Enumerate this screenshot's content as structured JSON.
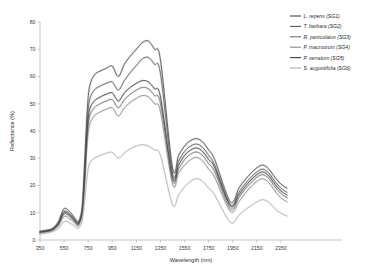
{
  "chart_data": {
    "type": "line",
    "title": "",
    "xlabel": "Wavelength (nm)",
    "ylabel": "Reflectance (%)",
    "xlim": [
      350,
      2400
    ],
    "ylim": [
      0,
      80
    ],
    "xticks": [
      350,
      550,
      750,
      950,
      1150,
      1350,
      1550,
      1750,
      1950,
      2150,
      2350
    ],
    "yticks": [
      0,
      10,
      20,
      30,
      40,
      50,
      60,
      70,
      80
    ],
    "grid": false,
    "legend_position": "top-right",
    "band_gaps": [
      [
        1350,
        1450
      ],
      [
        1800,
        1930
      ]
    ],
    "x": [
      350,
      400,
      450,
      500,
      550,
      600,
      650,
      670,
      700,
      720,
      740,
      760,
      800,
      850,
      900,
      950,
      1000,
      1050,
      1100,
      1150,
      1200,
      1250,
      1300,
      1350,
      1450,
      1500,
      1550,
      1600,
      1650,
      1700,
      1750,
      1800,
      1930,
      2000,
      2050,
      2100,
      2150,
      2200,
      2250,
      2300,
      2350,
      2400
    ],
    "series": [
      {
        "name": "L. repens (SG1)",
        "code": "SG1",
        "color": "#4a4a4a",
        "values": [
          3.2,
          3.6,
          4.2,
          6.5,
          11.5,
          10.2,
          7.4,
          6.8,
          12.0,
          28.0,
          46.0,
          56.0,
          60.5,
          62.0,
          63.0,
          63.8,
          60.0,
          64.5,
          67.5,
          70.0,
          72.5,
          73.0,
          70.0,
          66.0,
          26.5,
          31.0,
          34.5,
          36.5,
          37.2,
          36.0,
          33.0,
          29.5,
          14.0,
          19.0,
          22.0,
          24.5,
          26.5,
          27.5,
          26.0,
          23.0,
          20.5,
          19.0
        ]
      },
      {
        "name": "T. barbara (SG2)",
        "code": "SG2",
        "color": "#5a5a5a",
        "values": [
          3.0,
          3.3,
          3.9,
          6.0,
          10.5,
          9.4,
          6.8,
          6.3,
          11.0,
          25.0,
          42.0,
          51.0,
          55.0,
          56.5,
          57.5,
          58.0,
          55.0,
          58.5,
          61.5,
          64.0,
          66.5,
          67.0,
          64.5,
          61.0,
          24.5,
          29.0,
          32.5,
          34.5,
          35.2,
          34.0,
          31.0,
          27.5,
          13.0,
          17.5,
          20.5,
          23.0,
          25.0,
          26.0,
          24.5,
          21.5,
          19.0,
          17.5
        ]
      },
      {
        "name": "R. paniculatus (SG3)",
        "code": "SG3",
        "color": "#707070",
        "values": [
          2.8,
          3.1,
          3.6,
          5.5,
          9.5,
          8.5,
          6.2,
          5.8,
          10.0,
          22.0,
          37.0,
          45.0,
          48.5,
          50.0,
          51.0,
          51.5,
          48.5,
          51.5,
          53.5,
          55.0,
          56.0,
          55.5,
          53.0,
          50.0,
          22.0,
          26.0,
          29.5,
          31.5,
          32.3,
          31.0,
          28.0,
          25.0,
          11.5,
          15.5,
          18.5,
          21.0,
          23.0,
          24.0,
          22.5,
          19.5,
          17.0,
          15.5
        ]
      },
      {
        "name": "P. macrourum (SG4)",
        "code": "SG4",
        "color": "#8a8a8a",
        "values": [
          2.6,
          2.9,
          3.4,
          5.0,
          8.6,
          7.7,
          5.6,
          5.2,
          9.2,
          20.0,
          34.5,
          42.0,
          45.5,
          47.0,
          48.0,
          48.5,
          45.5,
          48.5,
          50.5,
          52.0,
          53.0,
          52.5,
          50.0,
          47.0,
          20.5,
          24.5,
          27.5,
          29.5,
          30.3,
          29.0,
          26.0,
          23.0,
          10.5,
          14.0,
          17.0,
          19.5,
          21.5,
          22.5,
          21.0,
          18.0,
          15.5,
          14.0
        ]
      },
      {
        "name": "P. serratum (SG5)",
        "code": "SG5",
        "color": "#3c3c3c",
        "values": [
          2.9,
          3.2,
          3.8,
          5.8,
          10.0,
          9.0,
          6.5,
          6.0,
          10.5,
          23.0,
          39.0,
          47.5,
          51.0,
          52.5,
          53.5,
          54.0,
          51.0,
          54.0,
          56.0,
          57.5,
          58.5,
          58.0,
          55.5,
          52.5,
          23.0,
          27.5,
          31.0,
          33.0,
          33.8,
          32.5,
          29.5,
          26.5,
          12.5,
          16.5,
          19.5,
          22.0,
          24.0,
          25.0,
          23.5,
          20.5,
          18.0,
          16.5
        ]
      },
      {
        "name": "S. augustifolia (SG6)",
        "code": "SG6",
        "color": "#b0b0b0",
        "values": [
          2.2,
          2.5,
          3.0,
          4.2,
          6.8,
          6.2,
          4.6,
          4.3,
          7.0,
          14.0,
          23.0,
          28.0,
          30.0,
          31.0,
          31.8,
          32.2,
          30.0,
          32.0,
          33.5,
          34.5,
          35.0,
          34.5,
          33.0,
          31.0,
          13.0,
          16.5,
          19.5,
          21.5,
          22.5,
          21.5,
          19.0,
          16.5,
          6.5,
          9.0,
          11.0,
          12.5,
          14.0,
          14.8,
          13.8,
          11.5,
          9.8,
          8.8
        ]
      }
    ]
  },
  "legend": {
    "entries": [
      {
        "label": "L. repens (SG1)"
      },
      {
        "label": "T. barbara (SG2)"
      },
      {
        "label": "R. paniculatus (SG3)"
      },
      {
        "label": "P. macrourum (SG4)"
      },
      {
        "label": "P. serratum (SG5)"
      },
      {
        "label": "S. augustifolia (SG6)"
      }
    ]
  }
}
